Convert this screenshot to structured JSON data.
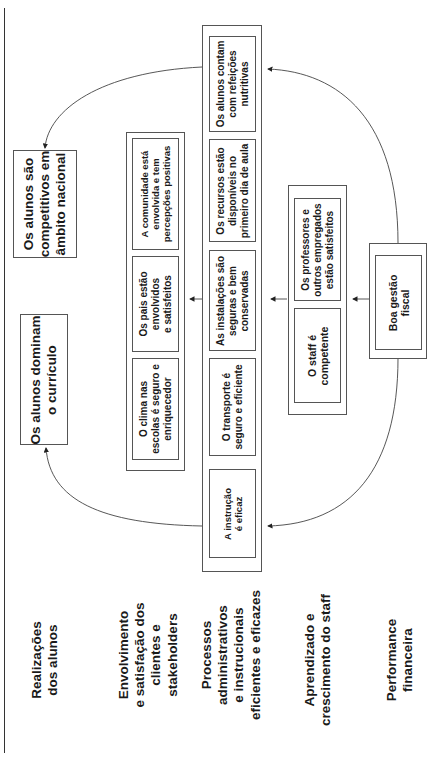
{
  "diagram": {
    "perspectives": [
      {
        "lines": [
          "Realizações",
          "dos alunos"
        ]
      },
      {
        "lines": [
          "Envolvimento",
          "e satisfação dos",
          "clientes e",
          "stakeholders"
        ]
      },
      {
        "lines": [
          "Processos",
          "administrativos",
          "e instrucionais",
          "eficientes e eficazes"
        ]
      },
      {
        "lines": [
          "Aprendizado e",
          "crescimento do staff"
        ]
      },
      {
        "lines": [
          "Performance",
          "financeira"
        ]
      }
    ],
    "student_results": [
      {
        "lines": [
          "Os alunos são",
          "competitivos em",
          "âmbito nacional"
        ]
      },
      {
        "lines": [
          "Os alunos dominam",
          "o currículo"
        ]
      }
    ],
    "stakeholders": [
      {
        "lines": [
          "A comunidade está",
          "envolvida e tem",
          "percepções positivas"
        ]
      },
      {
        "lines": [
          "Os pais estão",
          "envolvidos",
          "e satisfeitos"
        ]
      },
      {
        "lines": [
          "O clima nas",
          "escolas é seguro e",
          "enriquecedor"
        ]
      }
    ],
    "processes": [
      {
        "lines": [
          "Os alunos contam",
          "com refeições",
          "nutritivas"
        ]
      },
      {
        "lines": [
          "Os recursos estão",
          "disponíveis no",
          "primeiro dia de aula"
        ]
      },
      {
        "lines": [
          "As instalações são",
          "seguras e bem",
          "conservadas"
        ]
      },
      {
        "lines": [
          "O transporte é",
          "seguro e eficiente"
        ]
      },
      {
        "lines": [
          "A instrução",
          "é eficaz"
        ]
      }
    ],
    "staff": [
      {
        "lines": [
          "Os professores e",
          "outros empregados",
          "estão satisfeitos"
        ]
      },
      {
        "lines": [
          "O staff é",
          "competente"
        ]
      }
    ],
    "financial": [
      {
        "lines": [
          "Boa gestão",
          "fiscal"
        ]
      }
    ]
  }
}
